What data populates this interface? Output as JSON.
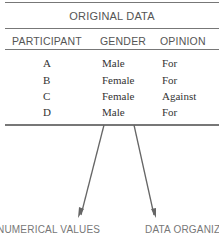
{
  "table": {
    "title": "ORIGINAL DATA",
    "headers": [
      "PARTICIPANT",
      "GENDER",
      "OPINION"
    ],
    "rows": [
      [
        "A",
        "Male",
        "For"
      ],
      [
        "B",
        "Female",
        "For"
      ],
      [
        "C",
        "Female",
        "Against"
      ],
      [
        "D",
        "Male",
        "For"
      ]
    ]
  },
  "arrows": {
    "left_label": "NUMERICAL VALUES",
    "right_label": "DATA ORGANIZ"
  }
}
